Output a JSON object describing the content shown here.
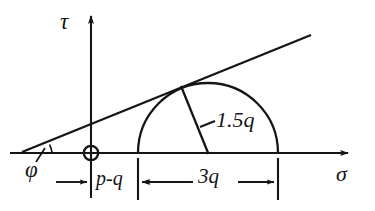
{
  "figure": {
    "kind": "mohr-circle-diagram",
    "background_color": "#ffffff",
    "ink_color": "#151515"
  },
  "axes": {
    "vertical": {
      "label": "τ",
      "label_name": "shear-stress-axis-label",
      "x": 91,
      "top_y": 12,
      "bottom_y": 196
    },
    "horizontal": {
      "label": "σ",
      "label_name": "normal-stress-axis-label",
      "y": 153,
      "left_x": 10,
      "right_x": 352
    },
    "origin": {
      "marker": "crossed-circle",
      "x": 91,
      "y": 153,
      "radius": 7
    }
  },
  "failure_line": {
    "name": "failure-envelope",
    "x1": 22,
    "y1": 152,
    "x2": 311,
    "y2": 35,
    "angle_label": "φ",
    "angle_label_name": "friction-angle-label"
  },
  "circle": {
    "name": "mohr-semicircle",
    "center_x": 208,
    "center_y": 153,
    "radius": 70,
    "left_x": 138,
    "right_x": 278,
    "radius_line": {
      "from_x": 208,
      "from_y": 153,
      "to_x": 181,
      "to_y": 86
    },
    "radius_label": "1.5q",
    "radius_label_name": "circle-radius-label"
  },
  "dimensions": [
    {
      "label": "p-q",
      "name": "dimension-p-minus-q",
      "from_x": 91,
      "to_x": 138,
      "y": 182
    },
    {
      "label": "3q",
      "name": "dimension-three-q",
      "from_x": 138,
      "to_x": 278,
      "y": 182
    }
  ],
  "extension_lines": [
    {
      "x": 91,
      "y1": 153,
      "y2": 198
    },
    {
      "x": 138,
      "y1": 158,
      "y2": 200
    },
    {
      "x": 278,
      "y1": 158,
      "y2": 200
    }
  ]
}
